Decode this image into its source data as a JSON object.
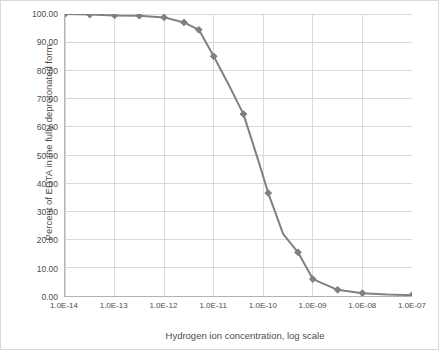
{
  "chart_data": {
    "type": "line",
    "title": "",
    "xlabel": "Hydrogen ion concentration, log scale",
    "ylabel": "Percent of EDTA in the fully deprotonated form",
    "x_tick_labels": [
      "1.0E-14",
      "1.0E-13",
      "1.0E-12",
      "1.0E-11",
      "1.0E-10",
      "1.0E-09",
      "1.0E-08",
      "1.0E-07"
    ],
    "x_log_min": -14,
    "x_log_max": -7,
    "y_tick_labels": [
      "0.00",
      "10.00",
      "20.00",
      "30.00",
      "40.00",
      "50.00",
      "60.00",
      "70.00",
      "80.00",
      "90.00",
      "100.00"
    ],
    "ylim": [
      0,
      100
    ],
    "grid": "horizontal-and-vertical",
    "legend": "none",
    "series": [
      {
        "name": "Percent fully deprotonated EDTA",
        "color": "#808080",
        "marker": "diamond",
        "x_log": [
          -14.0,
          -13.5,
          -13.0,
          -12.5,
          -12.0,
          -11.6,
          -11.3,
          -11.0,
          -10.7,
          -10.4,
          -10.1,
          -9.9,
          -9.6,
          -9.3,
          -9.0,
          -8.5,
          -8.0,
          -7.5,
          -7.0
        ],
        "y": [
          100.0,
          99.8,
          99.5,
          99.4,
          98.8,
          97.0,
          94.4,
          85.0,
          75.0,
          64.5,
          48.0,
          36.5,
          22.0,
          15.5,
          6.0,
          2.2,
          1.0,
          0.5,
          0.3
        ],
        "marker_points_x_log": [
          -14.0,
          -13.5,
          -13.0,
          -12.5,
          -12.0,
          -11.6,
          -11.3,
          -11.0,
          -10.4,
          -9.9,
          -9.3,
          -9.0,
          -8.5,
          -8.0,
          -7.0
        ],
        "marker_points_y": [
          100.0,
          99.8,
          99.5,
          99.4,
          98.8,
          97.0,
          94.4,
          85.0,
          64.5,
          36.5,
          15.5,
          6.0,
          2.2,
          1.0,
          0.3
        ]
      }
    ]
  },
  "colors": {
    "line": "#808080",
    "grid": "#d9d9d9",
    "axis": "#b3b3b3",
    "text": "#4d4d4d",
    "frame": "#d9d9d9",
    "background": "#ffffff"
  }
}
